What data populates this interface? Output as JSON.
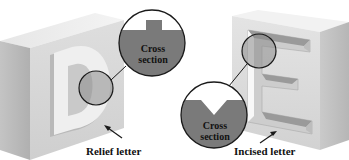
{
  "labels": {
    "relief": "Relief letter",
    "incised": "Incised letter",
    "cross_section_relief_line1": "Cross",
    "cross_section_relief_line2": "section",
    "cross_section_incised_line1": "Cross",
    "cross_section_incised_line2": "section"
  },
  "letters": {
    "relief": "D",
    "incised": "E"
  },
  "colors": {
    "background": "#ffffff",
    "block_front": "#d8d8d8",
    "block_top": "#ececec",
    "block_side": "#b8b8b8",
    "section_fill": "#7a7a7a",
    "outline": "#1a1a1a"
  }
}
